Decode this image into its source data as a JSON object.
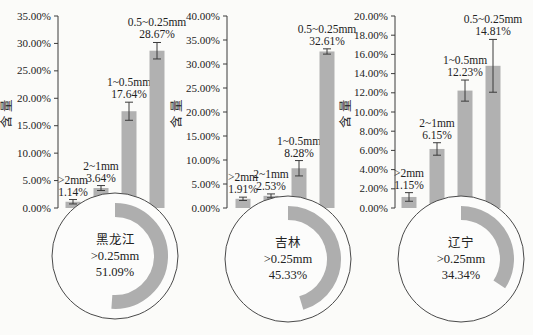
{
  "figure": {
    "background": "#fbfbf9",
    "colors": {
      "bar": "#b1b1b1",
      "arc": "#aeaeae",
      "axis": "#3b3b3b",
      "error_bar": "#3b3b3b",
      "text": "#222222",
      "circle_outline": "#4a4a4a",
      "circle_fill": "#fcfcfb"
    },
    "y_axis_title": "含量"
  },
  "chart_data": [
    {
      "type": "bar",
      "group": "黑龙江",
      "ylabel": "含量",
      "ylim": [
        0,
        35
      ],
      "yticks": [
        "35.00%",
        "30.00%",
        "25.00%",
        "20.00%",
        "15.00%",
        "10.00%",
        "5.00%",
        "0.00%"
      ],
      "categories": [
        ">2mm",
        "2~1mm",
        "1~0.5mm",
        "0.5~0.25mm"
      ],
      "values": [
        1.14,
        3.64,
        17.64,
        28.67
      ],
      "value_labels": [
        "1.14%",
        "3.64%",
        "17.64%",
        "28.67%"
      ],
      "error_bars": [
        0.4,
        0.45,
        1.65,
        1.5
      ],
      "donut": {
        "region": "黑龙江",
        "category": ">0.25mm",
        "value": 51.09,
        "value_label": "51.09%"
      }
    },
    {
      "type": "bar",
      "group": "吉林",
      "ylabel": "含量",
      "ylim": [
        0,
        40
      ],
      "yticks": [
        "40.00%",
        "35.00%",
        "30.00%",
        "25.00%",
        "20.00%",
        "15.00%",
        "10.00%",
        "5.00%",
        "0.00%"
      ],
      "categories": [
        ">2mm",
        "2~1mm",
        "1~0.5mm",
        "0.5~0.25mm"
      ],
      "values": [
        1.91,
        2.53,
        8.28,
        32.61
      ],
      "value_labels": [
        "1.91%",
        "2.53%",
        "8.28%",
        "32.61%"
      ],
      "error_bars": [
        0.35,
        0.4,
        1.6,
        0.55
      ],
      "donut": {
        "region": "吉林",
        "category": ">0.25mm",
        "value": 45.33,
        "value_label": "45.33%"
      }
    },
    {
      "type": "bar",
      "group": "辽宁",
      "ylabel": "含量",
      "ylim": [
        0,
        20
      ],
      "yticks": [
        "20.00%",
        "18.00%",
        "16.00%",
        "14.00%",
        "12.00%",
        "10.00%",
        "8.00%",
        "6.00%",
        "4.00%",
        "2.00%",
        "0.00%"
      ],
      "categories": [
        ">2mm",
        "2~1mm",
        "1~0.5mm",
        "0.5~0.25mm"
      ],
      "values": [
        1.15,
        6.15,
        12.23,
        14.81
      ],
      "value_labels": [
        "1.15%",
        "6.15%",
        "12.23%",
        "14.81%"
      ],
      "error_bars": [
        0.45,
        0.65,
        1.1,
        2.75
      ],
      "donut": {
        "region": "辽宁",
        "category": ">0.25mm",
        "value": 34.34,
        "value_label": "34.34%"
      }
    }
  ]
}
